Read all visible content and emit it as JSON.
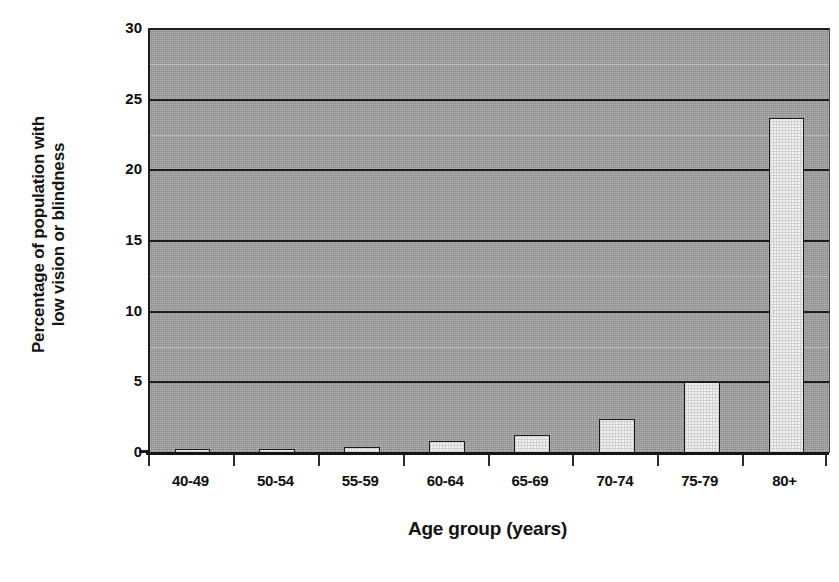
{
  "chart_data": {
    "type": "bar",
    "title": "",
    "xlabel": "Age group (years)",
    "ylabel": "Percentage of population with low vision or blindness",
    "ylabel_line1": "Percentage of population with",
    "ylabel_line2": "low vision or blindness",
    "categories": [
      "40-49",
      "50-54",
      "55-59",
      "60-64",
      "65-69",
      "70-74",
      "75-79",
      "80+"
    ],
    "values": [
      0.2,
      0.3,
      0.4,
      0.85,
      1.3,
      2.4,
      5.0,
      23.7
    ],
    "ylim": [
      0,
      30
    ],
    "yticks": [
      0,
      5,
      10,
      15,
      20,
      25,
      30
    ],
    "ytick_labels": [
      "0",
      "5",
      "10",
      "15",
      "20",
      "25",
      "30"
    ],
    "grid": true,
    "legend": false,
    "legend_position": "none",
    "series": [
      {
        "name": "Percentage of population with low vision or blindness",
        "values": [
          0.2,
          0.3,
          0.4,
          0.85,
          1.3,
          2.4,
          5.0,
          23.7
        ]
      }
    ]
  },
  "style": {
    "plot_background": "#9b9b9b",
    "bar_fill": "#f2f2f2",
    "bar_border": "#1a1a1a",
    "gridline_color": "#1c1c1c",
    "axis_color": "#141414",
    "text_color": "#0f0f0f"
  }
}
